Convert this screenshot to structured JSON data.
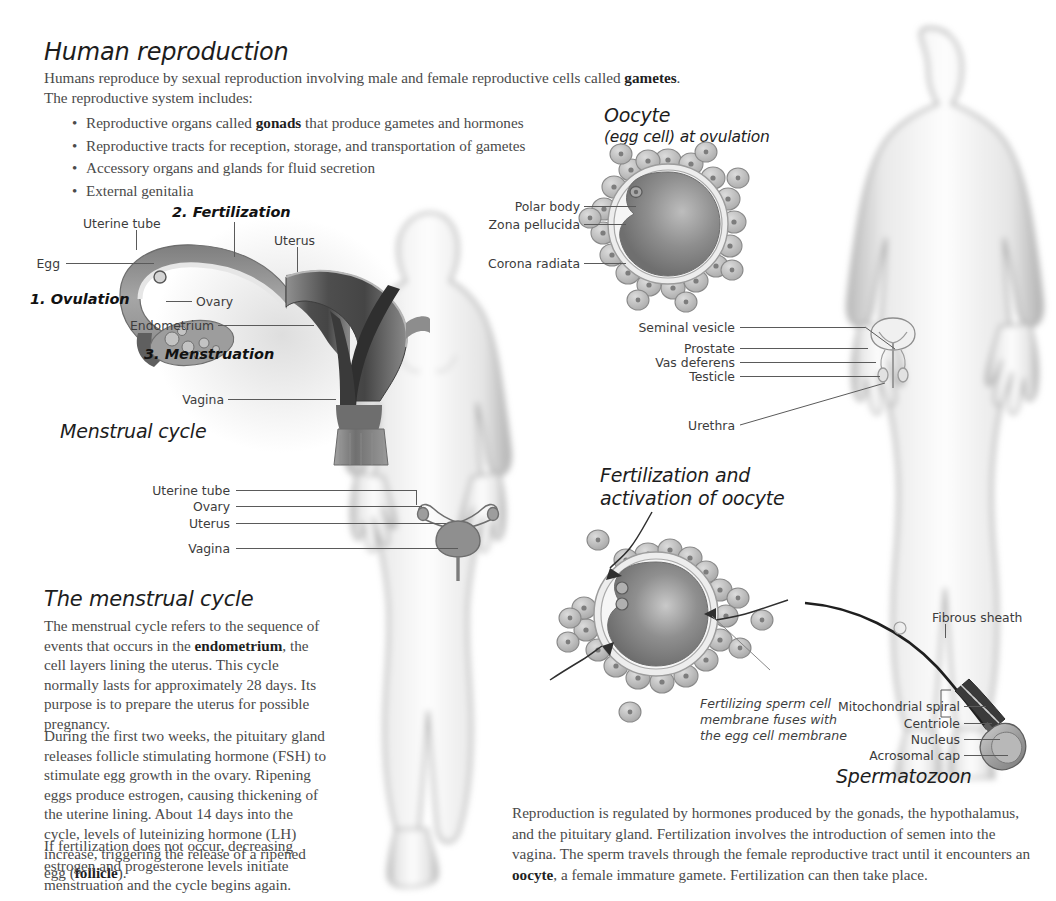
{
  "page": {
    "title": "Human reproduction",
    "intro": "Humans reproduce by sexual reproduction involving male and female reproductive cells called ",
    "intro_bold": "gametes",
    "intro_tail": ".",
    "intro_line2": "The reproductive system includes:",
    "bullets": [
      {
        "pre": "Reproductive organs called ",
        "bold": "gonads",
        "post": " that produce gametes and hormones"
      },
      {
        "pre": "Reproductive tracts for reception, storage, and transportation of gametes",
        "bold": "",
        "post": ""
      },
      {
        "pre": "Accessory organs and glands for fluid secretion",
        "bold": "",
        "post": ""
      },
      {
        "pre": "External genitalia",
        "bold": "",
        "post": ""
      }
    ]
  },
  "menstrual_diagram": {
    "caption": "Menstrual cycle",
    "steps": [
      {
        "label": "1. Ovulation"
      },
      {
        "label": "2. Fertilization"
      },
      {
        "label": "3. Menstruation"
      }
    ],
    "labels": [
      {
        "text": "Uterine tube"
      },
      {
        "text": "Egg"
      },
      {
        "text": "Uterus"
      },
      {
        "text": "Ovary"
      },
      {
        "text": "Endometrium"
      },
      {
        "text": "Vagina"
      }
    ]
  },
  "oocyte": {
    "title": "Oocyte",
    "subtitle": "(egg cell) at ovulation",
    "labels": [
      {
        "text": "Polar body"
      },
      {
        "text": "Zona pellucida"
      },
      {
        "text": "Corona radiata"
      }
    ]
  },
  "female_figure": {
    "labels": [
      {
        "text": "Uterine tube"
      },
      {
        "text": "Ovary"
      },
      {
        "text": "Uterus"
      },
      {
        "text": "Vagina"
      }
    ]
  },
  "male_figure": {
    "labels": [
      {
        "text": "Seminal vesicle"
      },
      {
        "text": "Prostate"
      },
      {
        "text": "Vas deferens"
      },
      {
        "text": "Testicle"
      },
      {
        "text": "Urethra"
      }
    ]
  },
  "fertilization": {
    "title_line1": "Fertilization and",
    "title_line2": "activation of oocyte",
    "caption": "Fertilizing sperm cell membrane fuses with the egg cell membrane"
  },
  "spermatozoon": {
    "title": "Spermatozoon",
    "labels": [
      {
        "text": "Fibrous sheath"
      },
      {
        "text": "Mitochondrial spiral"
      },
      {
        "text": "Centriole"
      },
      {
        "text": "Nucleus"
      },
      {
        "text": "Acrosomal cap"
      }
    ]
  },
  "menstrual_cycle_text": {
    "heading": "The menstrual cycle",
    "p1_a": "The menstrual cycle refers to the sequence of events that occurs in the ",
    "p1_bold": "endometrium",
    "p1_b": ", the cell layers lining the uterus. This cycle normally lasts for approximately 28 days. Its purpose is to prepare the uterus for possible pregnancy.",
    "p2_a": "During the first two weeks, the pituitary gland releases follicle stimulating hormone (FSH) to stimulate egg growth in the ovary. Ripening eggs produce estrogen, causing thickening of the uterine lining. About 14 days into the cycle, levels of luteinizing hormone (LH) increase, triggering the release of a ripened egg (",
    "p2_bold": "follicle",
    "p2_b": ").",
    "p3": "If fertilization does not occur, decreasing estrogen and progesterone levels initiate menstruation and the cycle begins again."
  },
  "summary": {
    "a": "Reproduction is regulated by hormones produced by the gonads, the hypothalamus, and the pituitary gland. Fertilization involves the introduction of semen into the vagina. The sperm travels through the female reproductive tract until it encounters an ",
    "bold": "oocyte",
    "b": ", a female immature gamete. Fertilization can then take place."
  },
  "colors": {
    "body_text": "#4a4a4a",
    "heading": "#1d1d1d",
    "leader_line": "#5a5a5a",
    "silhouette": "#b9b9b9",
    "organ_dark": "#6a6a6a",
    "organ_mid": "#9a9a9a",
    "organ_light": "#c8c8c8"
  }
}
